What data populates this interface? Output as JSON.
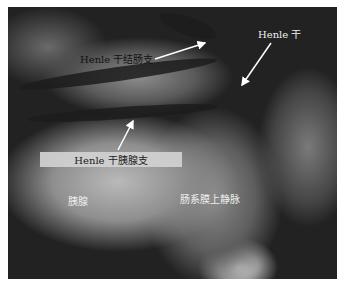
{
  "figure": {
    "labels": {
      "henle_colic_branch": "Henle 干结肠支",
      "henle_trunk": "Henle 干",
      "henle_pancreatic_branch": "Henle 干胰腺支",
      "pancreas": "胰腺",
      "smv": "肠系膜上静脉"
    },
    "colors": {
      "label_box": "#d2d2d2",
      "arrow": "#ffffff",
      "dark_text": "#111111",
      "light_text": "#eeeeee"
    }
  }
}
